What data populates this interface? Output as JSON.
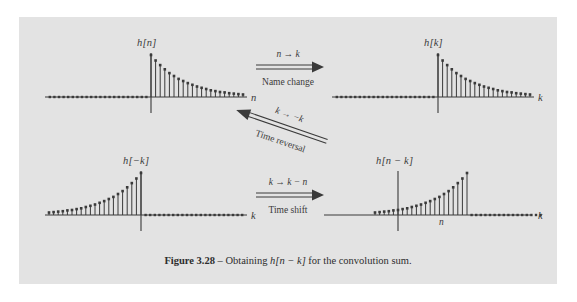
{
  "figure": {
    "caption_bold": "Figure 3.28",
    "caption_dash": " – Obtaining ",
    "caption_math": "h[n − k]",
    "caption_rest": " for the convolution sum.",
    "panel_color": "#e3e3e3",
    "ink_color": "#3a3a3a"
  },
  "plots": [
    {
      "id": "h-of-n",
      "title": "h[n]",
      "axis_label": "n",
      "tick_label": "",
      "shape": "decay-right",
      "peak_index": 0
    },
    {
      "id": "h-of-k",
      "title": "h[k]",
      "axis_label": "k",
      "tick_label": "",
      "shape": "decay-right",
      "peak_index": 0
    },
    {
      "id": "h-of-minus-k",
      "title": "h[−k]",
      "axis_label": "k",
      "tick_label": "",
      "shape": "decay-left",
      "peak_index": 0
    },
    {
      "id": "h-of-n-minus-k",
      "title": "h[n − k]",
      "axis_label": "k",
      "tick_label": "n",
      "shape": "decay-left-shifted",
      "peak_index": 9
    }
  ],
  "arrows": [
    {
      "id": "name-change",
      "top_label": "n → k",
      "bottom_label": "Name change",
      "direction": "right"
    },
    {
      "id": "time-reversal",
      "top_label": "k → −k",
      "bottom_label": "Time reversal",
      "direction": "left"
    },
    {
      "id": "time-shift",
      "top_label": "k → k − n",
      "bottom_label": "Time shift",
      "direction": "right"
    }
  ],
  "chart_data": {
    "type": "line",
    "title": "Obtaining h[n − k] for the convolution sum",
    "note": "Four discrete-time stem plots of a decaying exponential impulse response h = 0.87^m u[m], amplitude normalized to 1 at the peak.",
    "panels": [
      {
        "name": "h[n]",
        "xlabel": "n",
        "ylabel": "h[n]",
        "grid": false,
        "x": [
          -22,
          -21,
          -20,
          -19,
          -18,
          -17,
          -16,
          -15,
          -14,
          -13,
          -12,
          -11,
          -10,
          -9,
          -8,
          -7,
          -6,
          -5,
          -4,
          -3,
          -2,
          -1,
          0,
          1,
          2,
          3,
          4,
          5,
          6,
          7,
          8,
          9,
          10,
          11,
          12,
          13,
          14,
          15,
          16,
          17,
          18,
          19,
          20
        ],
        "y": [
          0,
          0,
          0,
          0,
          0,
          0,
          0,
          0,
          0,
          0,
          0,
          0,
          0,
          0,
          0,
          0,
          0,
          0,
          0,
          0,
          0,
          0,
          1.0,
          0.87,
          0.76,
          0.66,
          0.57,
          0.5,
          0.43,
          0.38,
          0.33,
          0.29,
          0.25,
          0.22,
          0.19,
          0.16,
          0.14,
          0.12,
          0.11,
          0.09,
          0.08,
          0.07,
          0.06
        ]
      },
      {
        "name": "h[k]",
        "xlabel": "k",
        "ylabel": "h[k]",
        "grid": false,
        "x": [
          -22,
          -21,
          -20,
          -19,
          -18,
          -17,
          -16,
          -15,
          -14,
          -13,
          -12,
          -11,
          -10,
          -9,
          -8,
          -7,
          -6,
          -5,
          -4,
          -3,
          -2,
          -1,
          0,
          1,
          2,
          3,
          4,
          5,
          6,
          7,
          8,
          9,
          10,
          11,
          12,
          13,
          14,
          15,
          16,
          17,
          18,
          19,
          20
        ],
        "y": [
          0,
          0,
          0,
          0,
          0,
          0,
          0,
          0,
          0,
          0,
          0,
          0,
          0,
          0,
          0,
          0,
          0,
          0,
          0,
          0,
          0,
          0,
          1.0,
          0.87,
          0.76,
          0.66,
          0.57,
          0.5,
          0.43,
          0.38,
          0.33,
          0.29,
          0.25,
          0.22,
          0.19,
          0.16,
          0.14,
          0.12,
          0.11,
          0.09,
          0.08,
          0.07,
          0.06
        ]
      },
      {
        "name": "h[-k]",
        "xlabel": "k",
        "ylabel": "h[−k]",
        "grid": false,
        "x": [
          -20,
          -19,
          -18,
          -17,
          -16,
          -15,
          -14,
          -13,
          -12,
          -11,
          -10,
          -9,
          -8,
          -7,
          -6,
          -5,
          -4,
          -3,
          -2,
          -1,
          0,
          1,
          2,
          3,
          4,
          5,
          6,
          7,
          8,
          9,
          10,
          11,
          12,
          13,
          14,
          15,
          16,
          17,
          18,
          19,
          20,
          21,
          22
        ],
        "y": [
          0.06,
          0.07,
          0.08,
          0.09,
          0.11,
          0.12,
          0.14,
          0.16,
          0.19,
          0.22,
          0.25,
          0.29,
          0.33,
          0.38,
          0.43,
          0.5,
          0.57,
          0.66,
          0.76,
          0.87,
          1.0,
          0,
          0,
          0,
          0,
          0,
          0,
          0,
          0,
          0,
          0,
          0,
          0,
          0,
          0,
          0,
          0,
          0,
          0,
          0,
          0,
          0,
          0
        ]
      },
      {
        "name": "h[n-k]",
        "xlabel": "k",
        "ylabel": "h[n − k]",
        "grid": false,
        "peak_at": 9,
        "x": [
          -14,
          -13,
          -12,
          -11,
          -10,
          -9,
          -8,
          -7,
          -6,
          -5,
          -4,
          -3,
          -2,
          -1,
          0,
          1,
          2,
          3,
          4,
          5,
          6,
          7,
          8,
          9,
          10,
          11,
          12,
          13,
          14,
          15,
          16,
          17,
          18,
          19,
          20,
          21,
          22,
          23,
          24,
          25,
          26,
          27,
          28
        ],
        "y": [
          0.06,
          0.07,
          0.08,
          0.09,
          0.11,
          0.12,
          0.14,
          0.16,
          0.19,
          0.22,
          0.25,
          0.29,
          0.33,
          0.38,
          0.43,
          0.5,
          0.57,
          0.66,
          0.76,
          0.87,
          1.0,
          0,
          0,
          0,
          0,
          0,
          0,
          0,
          0,
          0,
          0,
          0,
          0,
          0,
          0,
          0,
          0,
          0,
          0,
          0,
          0,
          0,
          0
        ]
      }
    ]
  }
}
